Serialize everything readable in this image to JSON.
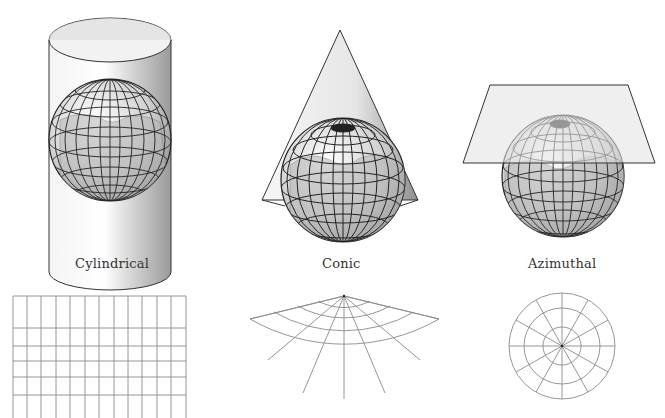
{
  "diagram": {
    "title": "",
    "projections": [
      {
        "id": "cylindrical",
        "label": "Cylindrical",
        "surface": "cylinder",
        "grid": "rectangular graticule"
      },
      {
        "id": "conic",
        "label": "Conic",
        "surface": "cone",
        "grid": "fan-shaped graticule"
      },
      {
        "id": "azimuthal",
        "label": "Azimuthal",
        "surface": "plane",
        "grid": "polar graticule"
      }
    ]
  },
  "colors": {
    "line": "#3a3a3a",
    "grid_line": "#8a8a8a",
    "globe_fill": "#d9d9d9",
    "land_fill": "#a8a8a8",
    "surface_fill": "#ececec",
    "text": "#333333"
  },
  "cylindrical_grid": {
    "columns": 12,
    "rows": 6
  },
  "conic_grid": {
    "meridians": 9,
    "parallels": 4
  },
  "azimuthal_grid": {
    "radial_lines": 12,
    "rings": 3
  }
}
